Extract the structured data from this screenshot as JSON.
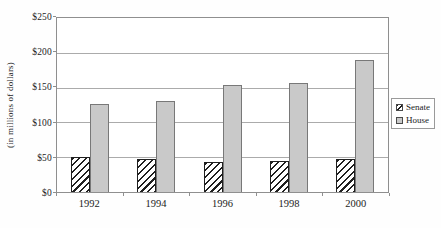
{
  "colors": {
    "house_fill": "#c9c9c9",
    "bar_border": "#787878",
    "hatch_line": "#1f1f1f",
    "hatch_background": "#ffffff",
    "gridline": "#ababab",
    "axis": "#8f8f8f",
    "text": "#1c1c1c"
  },
  "chart_data": {
    "type": "bar",
    "categories": [
      "1992",
      "1994",
      "1996",
      "1998",
      "2000"
    ],
    "series": [
      {
        "name": "Senate",
        "style": "hatch",
        "values": [
          51,
          47,
          43,
          45,
          48
        ]
      },
      {
        "name": "House",
        "style": "solid",
        "values": [
          127,
          131,
          154,
          156,
          190
        ]
      }
    ],
    "title": "",
    "xlabel": "",
    "ylabel": "(in millions of dollars)",
    "ylim": [
      0,
      250
    ],
    "ytick_step": 50,
    "ytick_labels": [
      "$0",
      "$50",
      "$100",
      "$150",
      "$200",
      "$250"
    ],
    "grid": true,
    "legend_position": "right",
    "legend_labels": [
      "Senate",
      "House"
    ]
  }
}
